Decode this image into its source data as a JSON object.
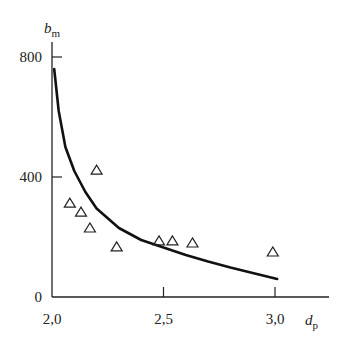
{
  "chart_data": {
    "type": "scatter",
    "title": "",
    "xlabel": "d",
    "xlabel_sub": "p",
    "ylabel": "b",
    "ylabel_sub": "m",
    "xlim": [
      2.0,
      3.1
    ],
    "ylim": [
      0,
      800
    ],
    "x_ticks": [
      {
        "value": 2.0,
        "label": "2,0"
      },
      {
        "value": 2.5,
        "label": "2,5"
      },
      {
        "value": 3.0,
        "label": "3,0"
      }
    ],
    "y_ticks": [
      {
        "value": 0,
        "label": "0"
      },
      {
        "value": 400,
        "label": "400"
      },
      {
        "value": 800,
        "label": "800"
      }
    ],
    "grid": false,
    "legend": null,
    "series": [
      {
        "name": "measured",
        "marker": "triangle-open",
        "points": [
          {
            "x": 2.08,
            "y": 313
          },
          {
            "x": 2.13,
            "y": 283
          },
          {
            "x": 2.17,
            "y": 230
          },
          {
            "x": 2.2,
            "y": 423
          },
          {
            "x": 2.29,
            "y": 167
          },
          {
            "x": 2.48,
            "y": 187
          },
          {
            "x": 2.54,
            "y": 187
          },
          {
            "x": 2.63,
            "y": 180
          },
          {
            "x": 2.99,
            "y": 150
          }
        ]
      },
      {
        "name": "fitted curve",
        "type": "line",
        "points": [
          {
            "x": 2.01,
            "y": 760
          },
          {
            "x": 2.03,
            "y": 620
          },
          {
            "x": 2.06,
            "y": 500
          },
          {
            "x": 2.1,
            "y": 420
          },
          {
            "x": 2.15,
            "y": 350
          },
          {
            "x": 2.2,
            "y": 295
          },
          {
            "x": 2.3,
            "y": 230
          },
          {
            "x": 2.4,
            "y": 190
          },
          {
            "x": 2.5,
            "y": 165
          },
          {
            "x": 2.6,
            "y": 140
          },
          {
            "x": 2.7,
            "y": 118
          },
          {
            "x": 2.8,
            "y": 98
          },
          {
            "x": 2.9,
            "y": 80
          },
          {
            "x": 3.01,
            "y": 60
          }
        ]
      }
    ]
  }
}
